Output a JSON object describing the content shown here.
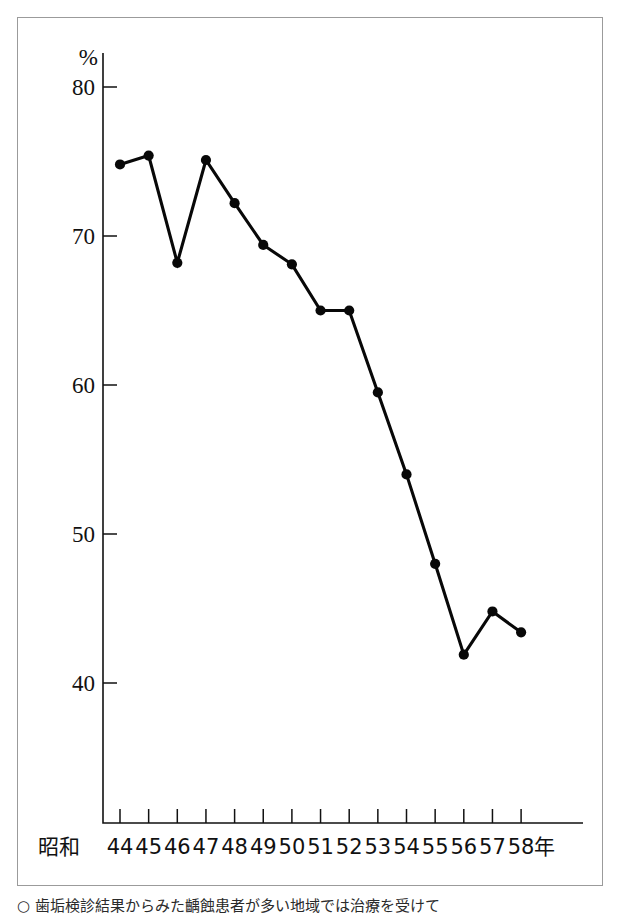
{
  "figure": {
    "y_axis_unit": "%",
    "x_axis_prefix": "昭和",
    "x_axis_suffix": "年",
    "caption": "○ 歯垢検診結果からみた齲蝕患者が多い地域では治療を受けて"
  },
  "chart_data": {
    "type": "line",
    "title": "",
    "subtitle": "",
    "xlabel": "昭和年",
    "ylabel": "%",
    "categories": [
      "44",
      "45",
      "46",
      "47",
      "48",
      "49",
      "50",
      "51",
      "52",
      "53",
      "54",
      "55",
      "56",
      "57",
      "58"
    ],
    "x": [
      44,
      45,
      46,
      47,
      48,
      49,
      50,
      51,
      52,
      53,
      54,
      55,
      56,
      57,
      58
    ],
    "values": [
      74.8,
      75.4,
      68.2,
      75.1,
      72.2,
      69.4,
      68.1,
      65.0,
      65.0,
      59.5,
      54.0,
      48.0,
      41.9,
      44.8,
      43.4
    ],
    "ylim": [
      30,
      80
    ],
    "xlim": [
      44,
      58
    ],
    "yticks": [
      40,
      50,
      60,
      70,
      80
    ],
    "ytick_labels": [
      "40",
      "50",
      "60",
      "70",
      "80"
    ],
    "xtick_labels": [
      "44",
      "45",
      "46",
      "47",
      "48",
      "49",
      "50",
      "51",
      "52",
      "53",
      "54",
      "55",
      "56",
      "57",
      "58"
    ],
    "grid": false,
    "legend": null,
    "marker": "filled-circle",
    "line_color": "#080808",
    "series": [
      {
        "name": "",
        "values": [
          74.8,
          75.4,
          68.2,
          75.1,
          72.2,
          69.4,
          68.1,
          65.0,
          65.0,
          59.5,
          54.0,
          48.0,
          41.9,
          44.8,
          43.4
        ]
      }
    ]
  }
}
